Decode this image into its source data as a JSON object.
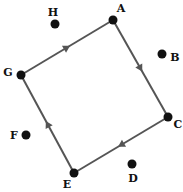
{
  "diagram": {
    "type": "directed-cycle",
    "edge_color": "#555555",
    "node_color": "#111111",
    "nodes": [
      {
        "id": "A",
        "label": "A",
        "x": 113,
        "y": 20,
        "lx": 121,
        "ly": 12,
        "on_cycle": true
      },
      {
        "id": "B",
        "label": "B",
        "x": 162,
        "y": 54,
        "lx": 175,
        "ly": 61,
        "on_cycle": false
      },
      {
        "id": "C",
        "label": "C",
        "x": 168,
        "y": 117,
        "lx": 178,
        "ly": 128,
        "on_cycle": true
      },
      {
        "id": "D",
        "label": "D",
        "x": 132,
        "y": 164,
        "lx": 133,
        "ly": 182,
        "on_cycle": false
      },
      {
        "id": "E",
        "label": "E",
        "x": 74,
        "y": 173,
        "lx": 67,
        "ly": 188,
        "on_cycle": true
      },
      {
        "id": "F",
        "label": "F",
        "x": 26,
        "y": 135,
        "lx": 14,
        "ly": 139,
        "on_cycle": false
      },
      {
        "id": "G",
        "label": "G",
        "x": 21,
        "y": 75,
        "lx": 8,
        "ly": 76,
        "on_cycle": true
      },
      {
        "id": "H",
        "label": "H",
        "x": 55,
        "y": 24,
        "lx": 53,
        "ly": 16,
        "on_cycle": false
      }
    ],
    "edges": [
      {
        "from": "G",
        "to": "A"
      },
      {
        "from": "A",
        "to": "C"
      },
      {
        "from": "C",
        "to": "E"
      },
      {
        "from": "E",
        "to": "G"
      }
    ]
  }
}
